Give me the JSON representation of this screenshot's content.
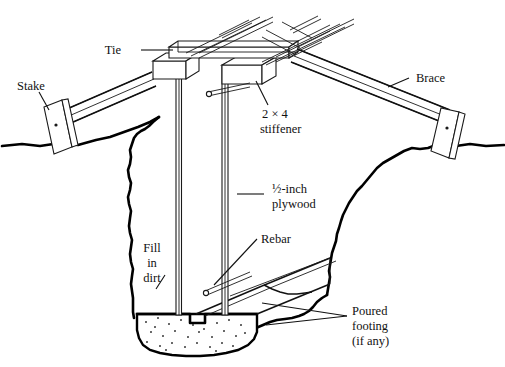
{
  "figure": {
    "background_color": "#ffffff",
    "line_color": "#111111"
  },
  "labels": {
    "tie": "Tie",
    "stake": "Stake",
    "brace": "Brace",
    "stiffener_line1": "2 × 4",
    "stiffener_line2": "stiffener",
    "plywood_line1": "½-inch",
    "plywood_line2": "plywood",
    "fill_line1": "Fill",
    "fill_line2": "in",
    "fill_line3": "dirt",
    "rebar": "Rebar",
    "footing_line1": "Poured",
    "footing_line2": "footing",
    "footing_line3": "(if any)"
  },
  "parts": [
    {
      "name": "tie",
      "label": "Tie",
      "description": "horizontal board across top of form walls"
    },
    {
      "name": "stake",
      "label": "Stake",
      "description": "driven ground stake anchoring the brace"
    },
    {
      "name": "brace",
      "label": "Brace",
      "description": "diagonal brace from stake to form top"
    },
    {
      "name": "stiffener",
      "label": "2 × 4 stiffener",
      "description": "vertical 2 by 4 stiffening the plywood form"
    },
    {
      "name": "plywood",
      "label": "½-inch plywood",
      "description": "form wall sheathing"
    },
    {
      "name": "fill-in-dirt",
      "label": "Fill in dirt",
      "description": "backfill against outside of form"
    },
    {
      "name": "rebar",
      "label": "Rebar",
      "description": "reinforcing steel bar through form"
    },
    {
      "name": "poured-footing",
      "label": "Poured footing (if any)",
      "description": "concrete footing below wall"
    }
  ]
}
